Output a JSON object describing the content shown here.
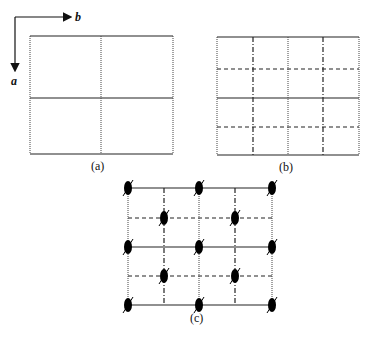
{
  "figure": {
    "axes": {
      "horizontal_label": "b",
      "vertical_label": "a"
    },
    "panels": [
      {
        "id": "a",
        "caption": "(a)",
        "description": "2x2 cell grid: solid horizontal lines, dotted vertical lines"
      },
      {
        "id": "b",
        "caption": "(b)",
        "description": "4x4 subdivided grid: solid and dashed horizontals, dotted and dash-dot verticals"
      },
      {
        "id": "c",
        "caption": "(c)",
        "description": "4x4 grid with black ellipsoidal symmetry markers at lattice points"
      }
    ],
    "colors": {
      "line": "#222222",
      "marker": "#000000",
      "background": "#ffffff"
    }
  }
}
